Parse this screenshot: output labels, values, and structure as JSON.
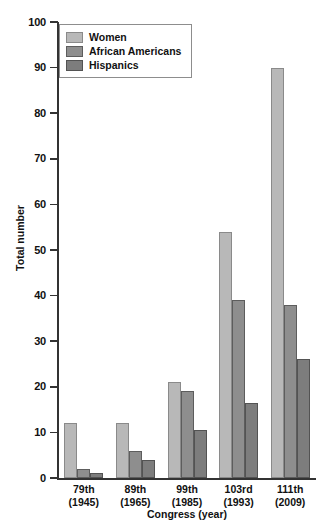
{
  "chart_data": {
    "type": "bar",
    "title": "",
    "xlabel": "Congress (year)",
    "ylabel": "Total number",
    "ylim": [
      0,
      100
    ],
    "yticks": [
      0,
      10,
      20,
      30,
      40,
      50,
      60,
      70,
      80,
      90,
      100
    ],
    "grid": false,
    "legend_position": "top-left",
    "categories": [
      "79th\n(1945)",
      "89th\n(1965)",
      "99th\n(1985)",
      "103rd\n(1993)",
      "111th\n(2009)"
    ],
    "category_labels": [
      {
        "congress": "79th",
        "year": "(1945)"
      },
      {
        "congress": "89th",
        "year": "(1965)"
      },
      {
        "congress": "99th",
        "year": "(1985)"
      },
      {
        "congress": "103rd",
        "year": "(1993)"
      },
      {
        "congress": "111th",
        "year": "(2009)"
      }
    ],
    "series": [
      {
        "name": "Women",
        "color": "#b8b8b8",
        "values": [
          12,
          12,
          21,
          54,
          90
        ]
      },
      {
        "name": "African Americans",
        "color": "#8e8e8e",
        "values": [
          2,
          6,
          19,
          39,
          38
        ]
      },
      {
        "name": "Hispanics",
        "color": "#7d7d7d",
        "values": [
          1,
          4,
          10.5,
          16.5,
          26
        ]
      }
    ]
  },
  "axis": {
    "y_title": "Total number",
    "x_title": "Congress (year)",
    "y_tick_labels": [
      "100",
      "90",
      "80",
      "70",
      "60",
      "50",
      "40",
      "30",
      "20",
      "10",
      "0"
    ]
  },
  "legend": {
    "items": [
      {
        "label": "Women",
        "color": "#b8b8b8"
      },
      {
        "label": "African Americans",
        "color": "#8e8e8e"
      },
      {
        "label": "Hispanics",
        "color": "#7d7d7d"
      }
    ]
  }
}
